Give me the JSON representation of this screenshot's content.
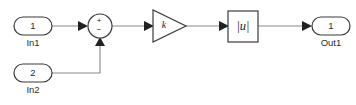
{
  "diagram": {
    "background_color": "#ffffff",
    "block_stroke_color": "#3a3a3a",
    "wire_color": "#8a8a8a",
    "arrow_color": "#222222",
    "blocks": {
      "in1": {
        "port_number": "1",
        "label": "In1",
        "type": "inport"
      },
      "in2": {
        "port_number": "2",
        "label": "In2",
        "type": "inport"
      },
      "sum": {
        "type": "sum",
        "sign_plus": "+",
        "sign_minus": "−"
      },
      "gain": {
        "type": "gain",
        "label": "k"
      },
      "abs": {
        "type": "abs",
        "label": "|u|"
      },
      "out1": {
        "port_number": "1",
        "label": "Out1",
        "type": "outport"
      }
    }
  }
}
